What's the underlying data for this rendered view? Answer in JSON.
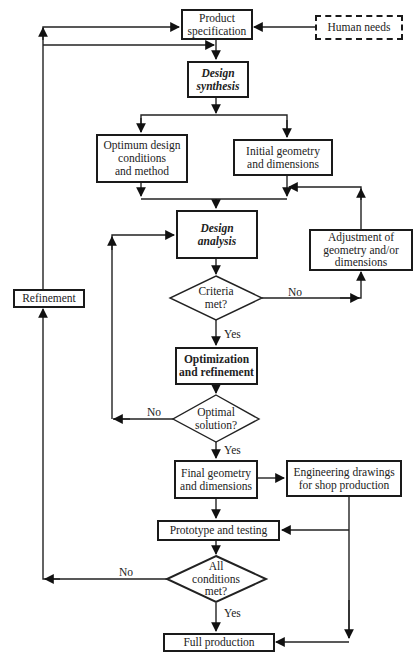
{
  "nodes": {
    "product_spec": "Product specification",
    "human_needs": "Human needs",
    "design_synthesis": "Design synthesis",
    "optimum_design": "Optimum design conditions and method",
    "initial_geometry": "Initial geometry and dimensions",
    "design_analysis": "Design analysis",
    "adjustment": "Adjustment of geometry and/or dimensions",
    "criteria_met": "Criteria met?",
    "optimization": "Optimization and refinement",
    "optimal_solution": "Optimal solution?",
    "final_geometry": "Final geometry and dimensions",
    "engineering_drawings": "Engineering drawings for shop production",
    "prototype": "Prototype and testing",
    "all_conditions": "All conditions met?",
    "full_production": "Full production",
    "refinement": "Refinement"
  },
  "node_lines": {
    "product_spec": [
      "Product",
      "specification"
    ],
    "design_synthesis": [
      "Design",
      "synthesis"
    ],
    "optimum_design": [
      "Optimum design",
      "conditions",
      "and method"
    ],
    "initial_geometry": [
      "Initial geometry",
      "and dimensions"
    ],
    "design_analysis": [
      "Design",
      "analysis"
    ],
    "adjustment": [
      "Adjustment of",
      "geometry and/or",
      "dimensions"
    ],
    "criteria_met": [
      "Criteria",
      "met?"
    ],
    "optimization": [
      "Optimization",
      "and refinement"
    ],
    "optimal_solution": [
      "Optimal",
      "solution?"
    ],
    "final_geometry": [
      "Final geometry",
      "and dimensions"
    ],
    "engineering_drawings": [
      "Engineering drawings",
      "for shop production"
    ],
    "all_conditions": [
      "All",
      "conditions",
      "met?"
    ]
  },
  "edge_labels": {
    "criteria_no": "No",
    "criteria_yes": "Yes",
    "optimal_no": "No",
    "optimal_yes": "Yes",
    "all_no": "No",
    "all_yes": "Yes"
  }
}
